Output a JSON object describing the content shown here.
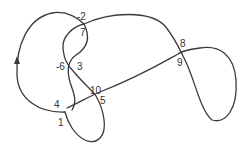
{
  "diagram": {
    "type": "knot-diagram-with-crossing-labels",
    "stroke_color": "#3a3a3a",
    "label_color": "#333333",
    "direction_arrow": "upward on left arc",
    "crossing_labels": [
      {
        "id": "l-2",
        "text": "-2"
      },
      {
        "id": "l7",
        "text": "7"
      },
      {
        "id": "l-6",
        "text": "-6"
      },
      {
        "id": "l3",
        "text": "3"
      },
      {
        "id": "l8",
        "text": "8"
      },
      {
        "id": "l9",
        "text": "9"
      },
      {
        "id": "l4",
        "text": "4"
      },
      {
        "id": "l10",
        "text": "10"
      },
      {
        "id": "l5",
        "text": "5"
      },
      {
        "id": "l1",
        "text": "1"
      }
    ],
    "crossings": [
      {
        "labels": [
          "-2",
          "7"
        ]
      },
      {
        "labels": [
          "-6",
          "3"
        ]
      },
      {
        "labels": [
          "8",
          "9"
        ]
      },
      {
        "labels": [
          "4",
          "1"
        ]
      },
      {
        "labels": [
          "10",
          "5"
        ]
      }
    ]
  }
}
